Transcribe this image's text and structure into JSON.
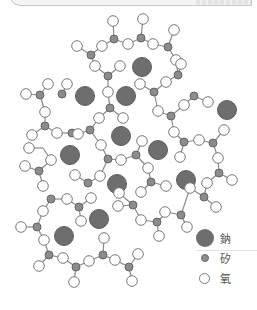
{
  "diagram": {
    "colors": {
      "sodium": "#6e6e6e",
      "silicon": "#8c8c8c",
      "oxygen": "#ffffff",
      "stroke": "#7a7a7a",
      "bond": "#8a8a8a"
    },
    "sodium": [
      [
        142,
        67
      ],
      [
        85,
        96
      ],
      [
        126,
        96
      ],
      [
        227,
        110
      ],
      [
        70,
        155
      ],
      [
        121,
        136
      ],
      [
        158,
        150
      ],
      [
        117,
        184
      ],
      [
        186,
        180
      ],
      [
        99,
        219
      ],
      [
        64,
        236
      ]
    ],
    "silicon": [
      [
        114,
        39
      ],
      [
        141,
        38
      ],
      [
        168,
        47
      ],
      [
        91,
        55
      ],
      [
        108,
        76
      ],
      [
        62,
        94
      ],
      [
        40,
        95
      ],
      [
        110,
        108
      ],
      [
        154,
        92
      ],
      [
        178,
        75
      ],
      [
        45,
        126
      ],
      [
        72,
        133
      ],
      [
        90,
        130
      ],
      [
        108,
        159
      ],
      [
        136,
        155
      ],
      [
        39,
        171
      ],
      [
        88,
        183
      ],
      [
        151,
        182
      ],
      [
        194,
        96
      ],
      [
        171,
        116
      ],
      [
        184,
        142
      ],
      [
        213,
        143
      ],
      [
        219,
        173
      ],
      [
        204,
        197
      ],
      [
        181,
        215
      ],
      [
        157,
        222
      ],
      [
        133,
        205
      ],
      [
        51,
        199
      ],
      [
        79,
        207
      ],
      [
        37,
        227
      ],
      [
        49,
        255
      ],
      [
        76,
        267
      ],
      [
        103,
        255
      ],
      [
        129,
        267
      ]
    ],
    "oxygen": [
      [
        113,
        21
      ],
      [
        143,
        19
      ],
      [
        174,
        30
      ],
      [
        77,
        46
      ],
      [
        102,
        46
      ],
      [
        128,
        44
      ],
      [
        153,
        44
      ],
      [
        176,
        60
      ],
      [
        95,
        66
      ],
      [
        120,
        66
      ],
      [
        108,
        92
      ],
      [
        67,
        84
      ],
      [
        48,
        84
      ],
      [
        26,
        94
      ],
      [
        45,
        112
      ],
      [
        99,
        118
      ],
      [
        123,
        118
      ],
      [
        140,
        84
      ],
      [
        166,
        82
      ],
      [
        181,
        64
      ],
      [
        158,
        111
      ],
      [
        184,
        105
      ],
      [
        208,
        102
      ],
      [
        32,
        135
      ],
      [
        57,
        133
      ],
      [
        78,
        134
      ],
      [
        29,
        148
      ],
      [
        51,
        160
      ],
      [
        101,
        145
      ],
      [
        121,
        160
      ],
      [
        100,
        176
      ],
      [
        25,
        166
      ],
      [
        43,
        186
      ],
      [
        75,
        175
      ],
      [
        142,
        141
      ],
      [
        148,
        168
      ],
      [
        166,
        186
      ],
      [
        141,
        192
      ],
      [
        174,
        132
      ],
      [
        199,
        140
      ],
      [
        224,
        130
      ],
      [
        218,
        158
      ],
      [
        180,
        157
      ],
      [
        232,
        180
      ],
      [
        207,
        183
      ],
      [
        190,
        188
      ],
      [
        216,
        207
      ],
      [
        165,
        212
      ],
      [
        187,
        227
      ],
      [
        119,
        193
      ],
      [
        118,
        206
      ],
      [
        141,
        220
      ],
      [
        159,
        236
      ],
      [
        67,
        199
      ],
      [
        91,
        198
      ],
      [
        81,
        221
      ],
      [
        43,
        211
      ],
      [
        21,
        227
      ],
      [
        44,
        240
      ],
      [
        39,
        266
      ],
      [
        63,
        258
      ],
      [
        74,
        282
      ],
      [
        89,
        261
      ],
      [
        104,
        238
      ],
      [
        115,
        260
      ],
      [
        138,
        254
      ],
      [
        132,
        281
      ]
    ],
    "bonds": [
      [
        [
          114,
          39
        ],
        [
          113,
          21
        ]
      ],
      [
        [
          114,
          39
        ],
        [
          102,
          46
        ]
      ],
      [
        [
          114,
          39
        ],
        [
          128,
          44
        ]
      ],
      [
        [
          141,
          38
        ],
        [
          143,
          19
        ]
      ],
      [
        [
          141,
          38
        ],
        [
          128,
          44
        ]
      ],
      [
        [
          141,
          38
        ],
        [
          153,
          44
        ]
      ],
      [
        [
          168,
          47
        ],
        [
          153,
          44
        ]
      ],
      [
        [
          168,
          47
        ],
        [
          174,
          30
        ]
      ],
      [
        [
          168,
          47
        ],
        [
          176,
          60
        ]
      ],
      [
        [
          91,
          55
        ],
        [
          77,
          46
        ]
      ],
      [
        [
          91,
          55
        ],
        [
          102,
          46
        ]
      ],
      [
        [
          91,
          55
        ],
        [
          95,
          66
        ]
      ],
      [
        [
          108,
          76
        ],
        [
          95,
          66
        ]
      ],
      [
        [
          108,
          76
        ],
        [
          120,
          66
        ]
      ],
      [
        [
          108,
          76
        ],
        [
          108,
          92
        ]
      ],
      [
        [
          110,
          108
        ],
        [
          108,
          92
        ]
      ],
      [
        [
          110,
          108
        ],
        [
          99,
          118
        ]
      ],
      [
        [
          110,
          108
        ],
        [
          123,
          118
        ]
      ],
      [
        [
          178,
          75
        ],
        [
          176,
          60
        ]
      ],
      [
        [
          178,
          75
        ],
        [
          181,
          64
        ]
      ],
      [
        [
          178,
          75
        ],
        [
          166,
          82
        ]
      ],
      [
        [
          154,
          92
        ],
        [
          166,
          82
        ]
      ],
      [
        [
          154,
          92
        ],
        [
          140,
          84
        ]
      ],
      [
        [
          154,
          92
        ],
        [
          158,
          111
        ]
      ],
      [
        [
          62,
          94
        ],
        [
          67,
          84
        ]
      ],
      [
        [
          40,
          95
        ],
        [
          48,
          84
        ]
      ],
      [
        [
          40,
          95
        ],
        [
          26,
          94
        ]
      ],
      [
        [
          40,
          95
        ],
        [
          45,
          112
        ]
      ],
      [
        [
          45,
          126
        ],
        [
          45,
          112
        ]
      ],
      [
        [
          45,
          126
        ],
        [
          32,
          135
        ]
      ],
      [
        [
          45,
          126
        ],
        [
          57,
          133
        ]
      ],
      [
        [
          72,
          133
        ],
        [
          57,
          133
        ]
      ],
      [
        [
          72,
          133
        ],
        [
          78,
          134
        ]
      ],
      [
        [
          90,
          130
        ],
        [
          78,
          134
        ]
      ],
      [
        [
          90,
          130
        ],
        [
          99,
          118
        ]
      ],
      [
        [
          90,
          130
        ],
        [
          101,
          145
        ]
      ],
      [
        [
          43,
          148
        ],
        [
          29,
          148
        ]
      ],
      [
        [
          43,
          148
        ],
        [
          51,
          160
        ]
      ],
      [
        [
          108,
          159
        ],
        [
          101,
          145
        ]
      ],
      [
        [
          108,
          159
        ],
        [
          121,
          160
        ]
      ],
      [
        [
          108,
          159
        ],
        [
          100,
          176
        ]
      ],
      [
        [
          136,
          155
        ],
        [
          121,
          160
        ]
      ],
      [
        [
          136,
          155
        ],
        [
          142,
          141
        ]
      ],
      [
        [
          136,
          155
        ],
        [
          148,
          168
        ]
      ],
      [
        [
          151,
          182
        ],
        [
          148,
          168
        ]
      ],
      [
        [
          151,
          182
        ],
        [
          166,
          186
        ]
      ],
      [
        [
          151,
          182
        ],
        [
          141,
          192
        ]
      ],
      [
        [
          39,
          171
        ],
        [
          25,
          166
        ]
      ],
      [
        [
          39,
          171
        ],
        [
          43,
          186
        ]
      ],
      [
        [
          39,
          171
        ],
        [
          51,
          160
        ]
      ],
      [
        [
          88,
          183
        ],
        [
          75,
          175
        ]
      ],
      [
        [
          88,
          183
        ],
        [
          100,
          176
        ]
      ],
      [
        [
          194,
          96
        ],
        [
          208,
          102
        ]
      ],
      [
        [
          194,
          96
        ],
        [
          184,
          105
        ]
      ],
      [
        [
          171,
          116
        ],
        [
          184,
          105
        ]
      ],
      [
        [
          171,
          116
        ],
        [
          158,
          111
        ]
      ],
      [
        [
          171,
          116
        ],
        [
          174,
          132
        ]
      ],
      [
        [
          184,
          142
        ],
        [
          174,
          132
        ]
      ],
      [
        [
          184,
          142
        ],
        [
          199,
          140
        ]
      ],
      [
        [
          184,
          142
        ],
        [
          180,
          157
        ]
      ],
      [
        [
          213,
          143
        ],
        [
          199,
          140
        ]
      ],
      [
        [
          213,
          143
        ],
        [
          224,
          130
        ]
      ],
      [
        [
          213,
          143
        ],
        [
          218,
          158
        ]
      ],
      [
        [
          219,
          173
        ],
        [
          218,
          158
        ]
      ],
      [
        [
          219,
          173
        ],
        [
          232,
          180
        ]
      ],
      [
        [
          219,
          173
        ],
        [
          207,
          183
        ]
      ],
      [
        [
          204,
          197
        ],
        [
          207,
          183
        ]
      ],
      [
        [
          204,
          197
        ],
        [
          190,
          188
        ]
      ],
      [
        [
          204,
          197
        ],
        [
          216,
          207
        ]
      ],
      [
        [
          181,
          215
        ],
        [
          190,
          188
        ]
      ],
      [
        [
          181,
          215
        ],
        [
          167,
          212
        ]
      ],
      [
        [
          181,
          215
        ],
        [
          187,
          227
        ]
      ],
      [
        [
          157,
          222
        ],
        [
          167,
          212
        ]
      ],
      [
        [
          157,
          222
        ],
        [
          141,
          220
        ]
      ],
      [
        [
          157,
          222
        ],
        [
          159,
          236
        ]
      ],
      [
        [
          133,
          205
        ],
        [
          141,
          220
        ]
      ],
      [
        [
          133,
          205
        ],
        [
          118,
          206
        ]
      ],
      [
        [
          133,
          205
        ],
        [
          119,
          193
        ]
      ],
      [
        [
          51,
          199
        ],
        [
          67,
          199
        ]
      ],
      [
        [
          51,
          199
        ],
        [
          43,
          211
        ]
      ],
      [
        [
          79,
          207
        ],
        [
          67,
          199
        ]
      ],
      [
        [
          79,
          207
        ],
        [
          91,
          198
        ]
      ],
      [
        [
          79,
          207
        ],
        [
          81,
          221
        ]
      ],
      [
        [
          37,
          227
        ],
        [
          43,
          211
        ]
      ],
      [
        [
          37,
          227
        ],
        [
          21,
          227
        ]
      ],
      [
        [
          37,
          227
        ],
        [
          44,
          240
        ]
      ],
      [
        [
          49,
          255
        ],
        [
          44,
          240
        ]
      ],
      [
        [
          49,
          255
        ],
        [
          39,
          266
        ]
      ],
      [
        [
          49,
          255
        ],
        [
          63,
          258
        ]
      ],
      [
        [
          76,
          267
        ],
        [
          63,
          258
        ]
      ],
      [
        [
          76,
          267
        ],
        [
          74,
          282
        ]
      ],
      [
        [
          76,
          267
        ],
        [
          89,
          261
        ]
      ],
      [
        [
          103,
          255
        ],
        [
          89,
          261
        ]
      ],
      [
        [
          103,
          255
        ],
        [
          104,
          238
        ]
      ],
      [
        [
          103,
          255
        ],
        [
          115,
          260
        ]
      ],
      [
        [
          129,
          267
        ],
        [
          115,
          260
        ]
      ],
      [
        [
          129,
          267
        ],
        [
          138,
          254
        ]
      ],
      [
        [
          129,
          267
        ],
        [
          132,
          281
        ]
      ]
    ]
  },
  "legend": {
    "items": [
      {
        "symbol": "sodium",
        "label": "鈉"
      },
      {
        "symbol": "silicon",
        "label": "矽"
      },
      {
        "symbol": "oxygen",
        "label": "氧"
      }
    ]
  }
}
